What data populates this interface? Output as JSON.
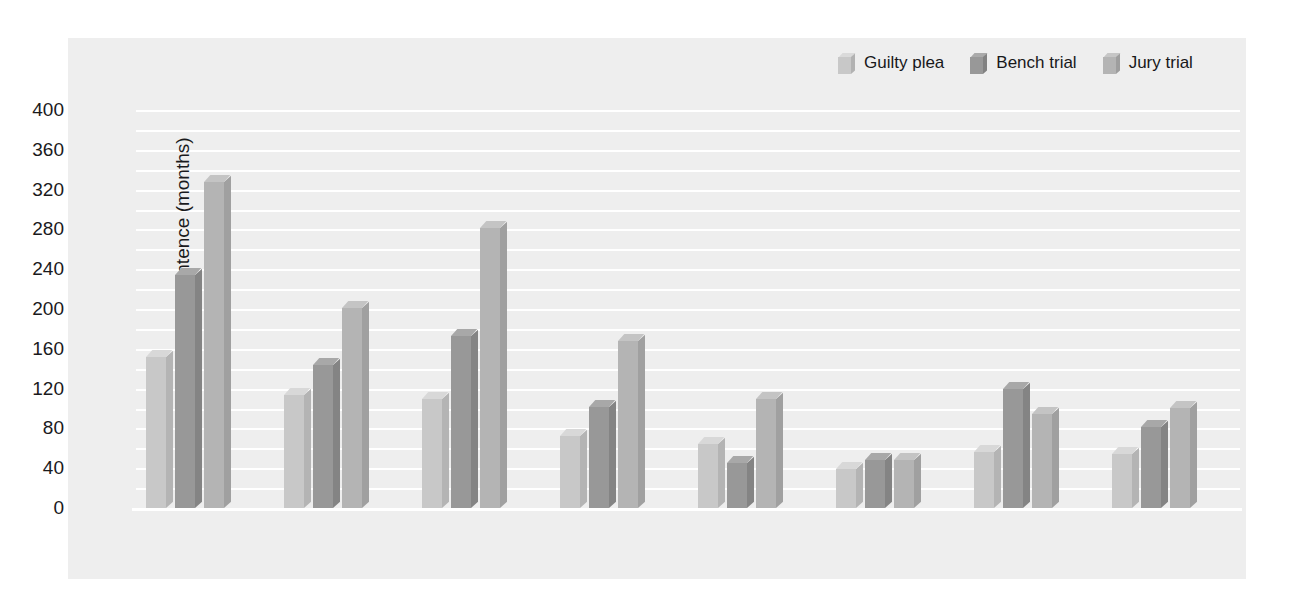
{
  "chart_data": {
    "type": "bar",
    "title": "",
    "xlabel": "",
    "ylabel": "Mean prison sentence (months)",
    "ylim": [
      0,
      400
    ],
    "ytick_step": 40,
    "yticks": [
      0,
      40,
      80,
      120,
      160,
      200,
      240,
      280,
      320,
      360,
      400
    ],
    "grid": true,
    "grid_orientation": "horizontal",
    "legend_position": "top-right",
    "categories": [
      "Murder",
      "Rape",
      "Robbery",
      "Aggravated assault",
      "Burglary",
      "Larceny",
      "Drug trafficking",
      "Other felonies"
    ],
    "series": [
      {
        "name": "Guilty plea",
        "color": "#c8c8c8",
        "values": [
          152,
          114,
          110,
          72,
          64,
          39,
          56,
          54
        ]
      },
      {
        "name": "Bench trial",
        "color": "#989898",
        "values": [
          234,
          144,
          173,
          102,
          45,
          48,
          120,
          81
        ]
      },
      {
        "name": "Jury trial",
        "color": "#b4b4b4",
        "values": [
          328,
          201,
          281,
          168,
          110,
          48,
          94,
          101
        ]
      }
    ]
  },
  "axis": {
    "y_title": "Mean prison sentence (months)",
    "y_tick_labels": [
      "400",
      "360",
      "320",
      "280",
      "240",
      "200",
      "160",
      "120",
      "80",
      "40",
      "0"
    ],
    "x_tick_labels": [
      "Murder",
      "Rape",
      "Robbery",
      "Aggravated\nassault",
      "Burglary",
      "Larceny",
      "Drug\ntrafficking",
      "Other\nfelonies"
    ]
  },
  "legend": {
    "items": [
      {
        "label": "Guilty plea",
        "color": "#c8c8c8"
      },
      {
        "label": "Bench trial",
        "color": "#989898"
      },
      {
        "label": "Jury trial",
        "color": "#b4b4b4"
      }
    ]
  },
  "style": {
    "panel_background": "#eeeeee",
    "page_background": "#ffffff",
    "gridline_color": "#ffffff",
    "text_color": "#1a1a1c",
    "shadow_color": "#e2e2e2"
  }
}
